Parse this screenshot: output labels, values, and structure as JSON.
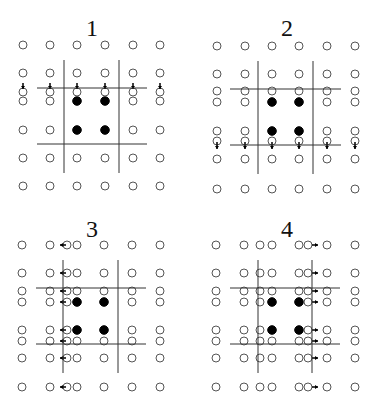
{
  "figure": {
    "colors": {
      "open_point": "#555555",
      "filled_point": "#000000",
      "line": "#333333",
      "arrow": "#000000"
    },
    "panels": [
      {
        "label": "1",
        "origin": [
          0,
          0
        ],
        "cols": [
          23,
          50,
          77,
          105,
          133,
          160
        ],
        "rows": [
          45,
          73,
          101,
          130,
          158,
          186
        ],
        "filled": [
          [
            2,
            2
          ],
          [
            3,
            2
          ],
          [
            2,
            3
          ],
          [
            3,
            3
          ]
        ],
        "vlines": [
          {
            "x": 64,
            "y1": 60,
            "y2": 173
          },
          {
            "x": 119,
            "y1": 60,
            "y2": 173
          }
        ],
        "hlines": [
          {
            "y": 88,
            "x1": 37,
            "x2": 147
          },
          {
            "y": 144,
            "x1": 37,
            "x2": 147
          }
        ],
        "extra_row": {
          "y": 92,
          "arrow": "down",
          "arrow_from": 83,
          "arrow_to": 89
        },
        "extra_col": null
      },
      {
        "label": "2",
        "origin": [
          189,
          0
        ],
        "cols": [
          217,
          245,
          272,
          299,
          327,
          355
        ],
        "rows": [
          46,
          74,
          102,
          131,
          159,
          189
        ],
        "filled": [
          [
            2,
            2
          ],
          [
            3,
            2
          ],
          [
            2,
            3
          ],
          [
            3,
            3
          ]
        ],
        "vlines": [
          {
            "x": 258,
            "y1": 61,
            "y2": 174
          },
          {
            "x": 313,
            "y1": 61,
            "y2": 174
          }
        ],
        "hlines": [
          {
            "y": 89,
            "x1": 230,
            "x2": 341
          },
          {
            "y": 145,
            "x1": 230,
            "x2": 341
          }
        ],
        "extra_row": {
          "y": 91,
          "arrow": null
        },
        "extra_row2": {
          "y": 141,
          "arrow": "down",
          "arrow_from": 142,
          "arrow_to": 149
        }
      },
      {
        "label": "3",
        "origin": [
          0,
          202
        ],
        "cols": [
          22,
          50,
          77,
          104,
          132,
          160
        ],
        "rows": [
          245,
          273,
          302,
          330,
          358,
          387
        ],
        "filled": [
          [
            2,
            2
          ],
          [
            3,
            2
          ],
          [
            2,
            3
          ],
          [
            3,
            3
          ]
        ],
        "vlines": [
          {
            "x": 63,
            "y1": 260,
            "y2": 373
          },
          {
            "x": 118,
            "y1": 260,
            "y2": 373
          }
        ],
        "hlines": [
          {
            "y": 288,
            "x1": 36,
            "x2": 146
          },
          {
            "y": 344,
            "x1": 36,
            "x2": 146
          }
        ],
        "extra_rows": [
          291,
          341
        ],
        "shift_col": {
          "x": 67,
          "arrow": "left",
          "arrow_from": 66,
          "arrow_to": 60
        }
      },
      {
        "label": "4",
        "origin": [
          189,
          202
        ],
        "cols": [
          216,
          244,
          272,
          299,
          327,
          355
        ],
        "rows": [
          245,
          273,
          302,
          330,
          358,
          387
        ],
        "filled": [
          [
            2,
            2
          ],
          [
            3,
            2
          ],
          [
            2,
            3
          ],
          [
            3,
            3
          ]
        ],
        "vlines": [
          {
            "x": 258,
            "y1": 260,
            "y2": 373
          },
          {
            "x": 312,
            "y1": 260,
            "y2": 373
          }
        ],
        "hlines": [
          {
            "y": 288,
            "x1": 230,
            "x2": 340
          },
          {
            "y": 344,
            "x1": 230,
            "x2": 340
          }
        ],
        "extra_rows": [
          291,
          341
        ],
        "shift_col_left": {
          "x": 260
        },
        "shift_col_right": {
          "x": 308,
          "arrow": "right",
          "arrow_from": 312,
          "arrow_to": 318
        }
      }
    ]
  },
  "labels": {
    "p1": "1",
    "p2": "2",
    "p3": "3",
    "p4": "4"
  }
}
